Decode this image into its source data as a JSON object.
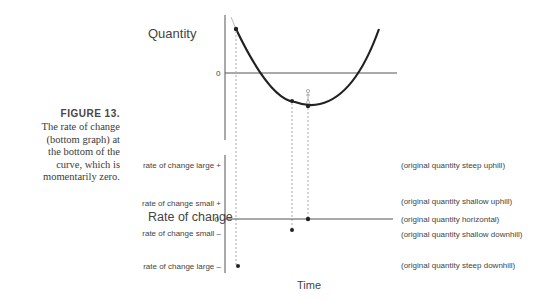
{
  "caption": {
    "figure_label": "FIGURE 13.",
    "text_lines": [
      "The rate of change",
      "(bottom graph) at",
      "the bottom of the",
      "curve, which is",
      "momentarily zero."
    ]
  },
  "top_graph": {
    "ylabel": "Quantity",
    "zero_label": "0"
  },
  "bottom_graph": {
    "ylabel": "Rate of change",
    "zero_label": "0",
    "left_labels": {
      "large_pos": "rate of change large +",
      "small_pos": "rate of change small +",
      "small_neg": "rate of change small –",
      "large_neg": "rate of change large –"
    },
    "right_labels": {
      "steep_up": "(original quantity steep uphill)",
      "shallow_up": "(original quantity shallow uphill)",
      "horizontal": "(original quantity horizontal)",
      "shallow_down": "(original quantity shallow downhill)",
      "steep_down": "(original quantity steep downhill)"
    },
    "xlabel": "Time"
  },
  "colors": {
    "curve": "#222222",
    "axis": "#555555",
    "dashed": "#aaaaaa",
    "figure_label": "#4a4545"
  }
}
